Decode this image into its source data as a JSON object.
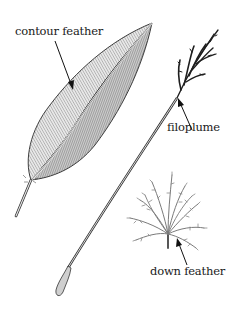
{
  "diagram": {
    "type": "labeled-illustration",
    "labels": [
      {
        "id": "contour",
        "text": "contour feather"
      },
      {
        "id": "filoplume",
        "text": "filoplume"
      },
      {
        "id": "down",
        "text": "down feather"
      }
    ],
    "colors": {
      "ink": "#1a1a1a",
      "vane_fill": "#d9d9d9",
      "vane_dark": "#8a8a8a",
      "down_fill": "#9a9a9a",
      "background": "#ffffff"
    }
  }
}
